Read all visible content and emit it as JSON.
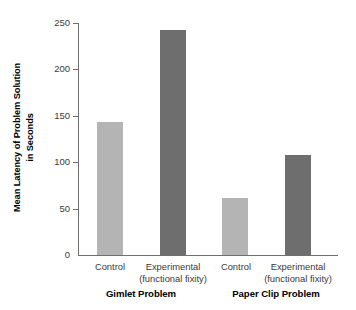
{
  "chart_data": {
    "type": "bar",
    "title": "",
    "subtitle": "",
    "xlabel": "",
    "ylabel": "Mean Latency of Problem Solution in Seconds",
    "ylabel_line1": "Mean Latency of Problem Solution",
    "ylabel_line2": "in Seconds",
    "ylim": [
      0,
      250
    ],
    "yticks": [
      0,
      50,
      100,
      150,
      200,
      250
    ],
    "ytick_labels": [
      "0",
      "50",
      "100",
      "150",
      "200",
      "250"
    ],
    "grid": false,
    "legend": false,
    "categories": [
      "Control",
      "Experimental (functional fixity)",
      "Control",
      "Experimental (functional fixity)"
    ],
    "values": [
      143,
      243,
      61,
      108
    ],
    "bar_colors": [
      "#b4b4b4",
      "#6e6e6e",
      "#b4b4b4",
      "#6e6e6e"
    ],
    "groups": [
      "Gimlet Problem",
      "Paper Clip Problem"
    ],
    "bars": [
      {
        "label_line1": "Control",
        "label_line2": "",
        "value": 143,
        "color": "#b4b4b4",
        "group": "Gimlet Problem"
      },
      {
        "label_line1": "Experimental",
        "label_line2": "(functional fixity)",
        "value": 243,
        "color": "#6e6e6e",
        "group": "Gimlet Problem"
      },
      {
        "label_line1": "Control",
        "label_line2": "",
        "value": 61,
        "color": "#b4b4b4",
        "group": "Paper Clip Problem"
      },
      {
        "label_line1": "Experimental",
        "label_line2": "(functional fixity)",
        "value": 108,
        "color": "#6e6e6e",
        "group": "Paper Clip Problem"
      }
    ]
  },
  "axis": {
    "tick_0": "0",
    "tick_50": "50",
    "tick_100": "100",
    "tick_150": "150",
    "tick_200": "200",
    "tick_250": "250"
  },
  "labels": {
    "bar1_line1": "Control",
    "bar2_line1": "Experimental",
    "bar2_line2": "(functional fixity)",
    "bar3_line1": "Control",
    "bar4_line1": "Experimental",
    "bar4_line2": "(functional fixity)",
    "group1": "Gimlet Problem",
    "group2": "Paper Clip Problem",
    "ylabel_line1": "Mean Latency of Problem Solution",
    "ylabel_line2": "in Seconds"
  },
  "colors": {
    "bar_light": "#b4b4b4",
    "bar_dark": "#6e6e6e",
    "axis": "#6f6f6f",
    "tick_text": "#3a3a3a",
    "title_text": "#000000",
    "background": "#ffffff"
  }
}
